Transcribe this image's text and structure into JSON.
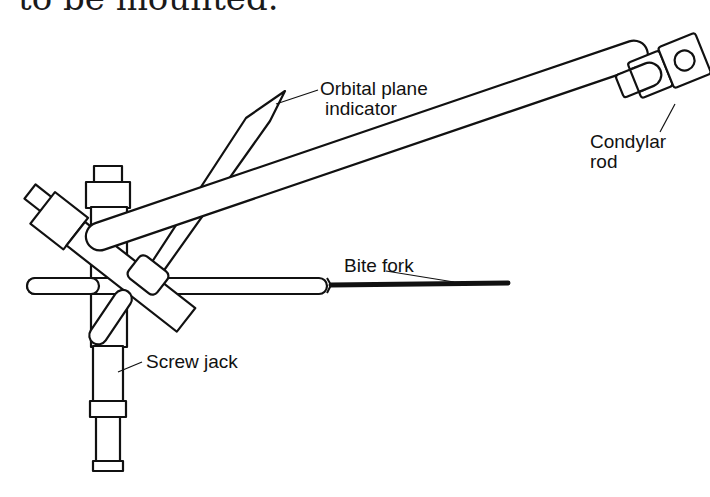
{
  "figure": {
    "caption_fragment": "to be mounted.",
    "labels": {
      "orbital_line1": "Orbital plane",
      "orbital_line2": "indicator",
      "condylar_line1": "Condylar",
      "condylar_line2": "rod",
      "bite_fork": "Bite fork",
      "screw_jack": "Screw jack"
    },
    "colors": {
      "ink": "#111111",
      "background": "#ffffff"
    }
  }
}
